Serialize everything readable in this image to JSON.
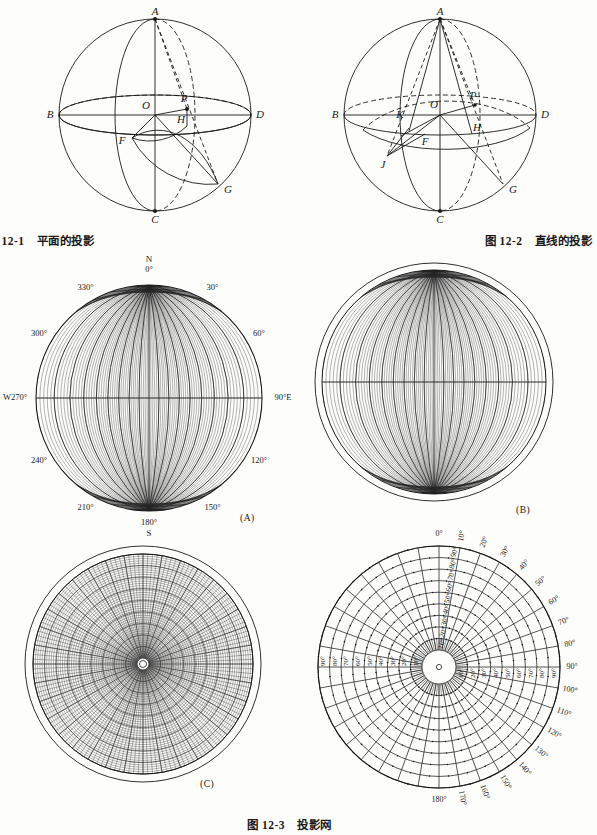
{
  "figures": [
    {
      "id": "fig-12-1",
      "caption_num": "图 12-1",
      "caption_text": "平面的投影",
      "points": [
        "A",
        "B",
        "C",
        "D",
        "O",
        "P",
        "H",
        "F",
        "G"
      ]
    },
    {
      "id": "fig-12-2",
      "caption_num": "图 12-2",
      "caption_text": "直线的投影",
      "points": [
        "A",
        "B",
        "C",
        "D",
        "O",
        "P",
        "H",
        "F",
        "G",
        "K",
        "J"
      ]
    },
    {
      "id": "fig-12-3",
      "caption_num": "图 12-3",
      "caption_text": "投影网"
    }
  ],
  "nets": {
    "a": {
      "tag": "(A)",
      "cardinal": {
        "north": "N",
        "south": "S",
        "west": "W",
        "east": "E"
      },
      "bearings": [
        "0°",
        "30°",
        "60°",
        "90°",
        "120°",
        "150°",
        "180°",
        "210°",
        "240°",
        "270°",
        "300°",
        "330°"
      ],
      "west_label": "W270°",
      "east_label": "90°E",
      "north_label": "0°",
      "south_label": "180°"
    },
    "b": {
      "tag": "(B)"
    },
    "c": {
      "tag": "(C)"
    },
    "d": {
      "outer_bearings": [
        "0°",
        "10°",
        "20°",
        "30°",
        "40°",
        "50°",
        "60°",
        "70°",
        "80°",
        "90°",
        "100°",
        "110°",
        "120°",
        "130°",
        "140°",
        "150°",
        "160°",
        "170°",
        "180°"
      ],
      "radial_dips": [
        "10°",
        "20°",
        "30°",
        "40°",
        "50°",
        "60°",
        "70°",
        "80°",
        "90°"
      ]
    }
  },
  "chart_data": [
    {
      "type": "scatter",
      "title": "平面的投影",
      "description": "Sphere with great circles showing projection of a plane",
      "labels": [
        "A",
        "B",
        "C",
        "D",
        "O",
        "P",
        "H",
        "F",
        "G"
      ]
    },
    {
      "type": "scatter",
      "title": "直线的投影",
      "description": "Sphere with great circles showing projection of a line",
      "labels": [
        "A",
        "B",
        "C",
        "D",
        "O",
        "P",
        "H",
        "F",
        "G",
        "K",
        "J"
      ]
    },
    {
      "type": "scatter",
      "title": "投影网",
      "description": "Four stereographic projection nets: (A) Wulff equal-angle net with compass bearings, (B) Schmidt equal-area net, (C) polar equal-area net, (D) polar coordinate net with bearing and dip graduations",
      "categories": [
        "0°",
        "10°",
        "20°",
        "30°",
        "40°",
        "50°",
        "60°",
        "70°",
        "80°",
        "90°",
        "100°",
        "110°",
        "120°",
        "130°",
        "140°",
        "150°",
        "160°",
        "170°",
        "180°"
      ],
      "values": [
        0,
        10,
        20,
        30,
        40,
        50,
        60,
        70,
        80,
        90,
        100,
        110,
        120,
        130,
        140,
        150,
        160,
        170,
        180
      ],
      "xlabel": "Bearing (degrees)",
      "ylabel": "Dip (degrees)",
      "ylim": [
        0,
        90
      ]
    }
  ]
}
